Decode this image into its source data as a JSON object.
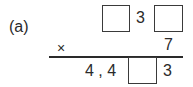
{
  "problem": {
    "label": "(a)",
    "multiplicand": {
      "digit_middle": "3"
    },
    "multiplier": {
      "operator": "×",
      "digit": "7"
    },
    "product": {
      "prefix": "4 , 4",
      "digit_last": "3"
    }
  }
}
